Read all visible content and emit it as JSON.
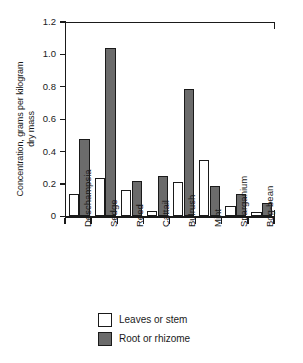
{
  "chart_data": {
    "type": "bar",
    "title": "",
    "xlabel": "",
    "ylabel": "Concentration, grams per kilogram\ndry mass",
    "ylim": [
      0,
      1.2
    ],
    "yticks": [
      "0",
      "0.2",
      "0.4",
      "0.6",
      "0.8",
      "1.0",
      "1.2"
    ],
    "ytick_values": [
      0,
      0.2,
      0.4,
      0.6,
      0.8,
      1.0,
      1.2
    ],
    "grid": false,
    "legend_position": "bottom-center",
    "categories": [
      "Deschampsia",
      "Sedge",
      "Reed",
      "Cattail",
      "Bulrush",
      "Mint",
      "Sparganium",
      "Bog-bean"
    ],
    "series": [
      {
        "name": "Leaves or stem",
        "color": "#ffffff",
        "values": [
          0.14,
          0.235,
          0.165,
          0.03,
          0.21,
          0.35,
          0.065,
          0.025
        ]
      },
      {
        "name": "Root or rhizome",
        "color": "#6b6b6b",
        "values": [
          0.475,
          1.04,
          0.22,
          0.25,
          0.785,
          0.19,
          0.14,
          0.08
        ]
      }
    ]
  },
  "legend": {
    "items": [
      {
        "label": "Leaves or stem",
        "swatch": "leaves"
      },
      {
        "label": "Root or rhizome",
        "swatch": "root"
      }
    ]
  }
}
